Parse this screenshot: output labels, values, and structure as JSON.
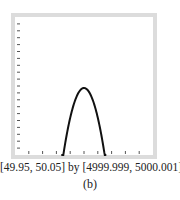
{
  "chart_data": {
    "type": "line",
    "title": "",
    "function_shape": "downward parabola",
    "window": {
      "xmin": 49.95,
      "xmax": 50.05,
      "ymin": 4999.999,
      "ymax": 5000.001
    },
    "x_ticks_count": 9,
    "y_ticks_count": 19,
    "vertex": {
      "x": 50.0,
      "y": 5000.0
    },
    "x_intercepts_with_bottom_edge": [
      49.985,
      50.015
    ],
    "grid": false,
    "legend": null,
    "colors": {
      "curve": "#111111",
      "frame": "#dcdcdc",
      "ticks": "#555555"
    }
  },
  "captions": {
    "window": "[49.95, 50.05] by [4999.999, 5000.001]",
    "panel_label": "(b)"
  }
}
